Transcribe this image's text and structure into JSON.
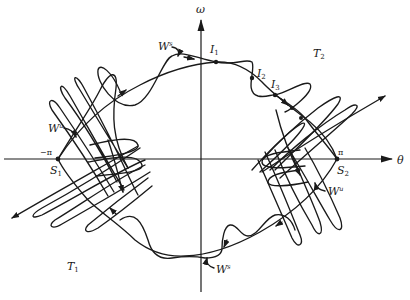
{
  "figure": {
    "type": "phase portrait",
    "axes": {
      "x": {
        "label": "θ",
        "tick_left": "−π",
        "tick_right": "π"
      },
      "y": {
        "label": "ω"
      }
    },
    "points": {
      "s1": {
        "label": "S",
        "sub": "1"
      },
      "s2": {
        "label": "S",
        "sub": "2"
      },
      "i1": {
        "label": "I",
        "sub": "1"
      },
      "i2": {
        "label": "I",
        "sub": "2"
      },
      "i3": {
        "label": "I",
        "sub": "3"
      }
    },
    "regions": {
      "t1": {
        "label": "T",
        "sub": "1"
      },
      "t2": {
        "label": "T",
        "sub": "2"
      }
    },
    "manifolds": {
      "ws_top": {
        "label": "W",
        "sup": "s"
      },
      "ws_bottom": {
        "label": "W",
        "sup": "s"
      },
      "wu_left": {
        "label": "W",
        "sup": "u"
      },
      "wu_right": {
        "label": "W",
        "sup": "u"
      }
    },
    "colors": {
      "ink": "#1a1a1a",
      "background": "#ffffff"
    }
  }
}
